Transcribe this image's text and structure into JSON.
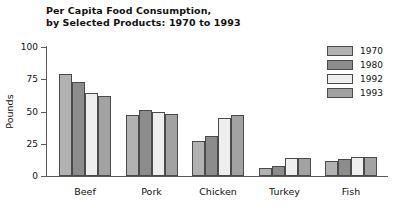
{
  "chart_data": {
    "type": "bar",
    "title_line1": "Per Capita Food Consumption,",
    "title_line2": "by Selected Products: 1970 to 1993",
    "xlabel": "",
    "ylabel": "Pounds",
    "ylim": [
      0,
      100
    ],
    "yticks": [
      0,
      25,
      50,
      75,
      100
    ],
    "ytick_labels": [
      "0",
      "25",
      "50",
      "75",
      "100"
    ],
    "grid": false,
    "legend_position": "right",
    "categories": [
      "Beef",
      "Pork",
      "Chicken",
      "Turkey",
      "Fish"
    ],
    "series": [
      {
        "name": "1970",
        "color": "#b2b2b2",
        "values": [
          79,
          47,
          27,
          6,
          12
        ]
      },
      {
        "name": "1980",
        "color": "#8c8c8c",
        "values": [
          73,
          51,
          31,
          8,
          13
        ]
      },
      {
        "name": "1992",
        "color": "#eeeeee",
        "values": [
          64,
          50,
          45,
          14,
          15
        ]
      },
      {
        "name": "1993",
        "color": "#a2a2a2",
        "values": [
          62,
          48,
          47,
          14,
          15
        ]
      }
    ]
  },
  "legend": {
    "items": [
      {
        "label": "1970",
        "color": "#b2b2b2"
      },
      {
        "label": "1980",
        "color": "#8c8c8c"
      },
      {
        "label": "1992",
        "color": "#eeeeee"
      },
      {
        "label": "1993",
        "color": "#a2a2a2"
      }
    ]
  },
  "axes": {
    "y_title": "Pounds",
    "y_tick_labels": [
      "100",
      "75",
      "50",
      "25",
      "0"
    ],
    "x_tick_labels": [
      "Beef",
      "Pork",
      "Chicken",
      "Turkey",
      "Fish"
    ]
  },
  "colors": {
    "axis": "#5a5a5a",
    "bar_border": "#4a4a4a",
    "text": "#111111",
    "background": "#ffffff"
  }
}
